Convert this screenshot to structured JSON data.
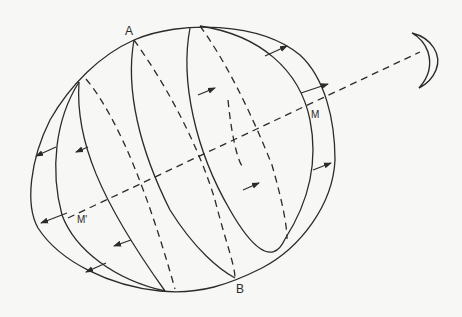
{
  "diagram": {
    "type": "tidal-bulge-illustration",
    "labels": {
      "top_pole": "A",
      "bottom_pole": "B",
      "near_point": "M",
      "far_point": "M'"
    },
    "elements": {
      "earth": "elongated ellipse (tidal bulge) with meridians",
      "front_meridians": "solid lines",
      "back_meridians": "dashed lines",
      "axis": "dashed line from M' through M toward the Moon",
      "moon": "crescent at upper right",
      "arrows": "tidal force vectors pointing outward along the Earth–Moon axis"
    },
    "colors": {
      "background": "#f7f7f5",
      "ink": "#2b2b2b"
    }
  }
}
